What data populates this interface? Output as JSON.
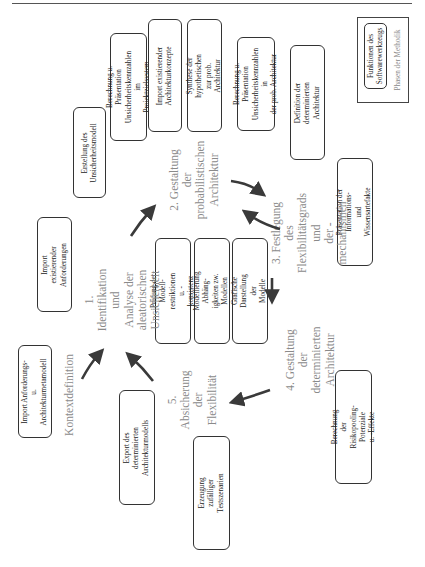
{
  "legend": {
    "tool_functions": "Funktionen des\nSoftwarewerkzeugs",
    "method_phases": "Phasen der Methodik"
  },
  "phases": {
    "context": "Kontextdefinition",
    "phase1": "1. Identifikation und\nAnalyse der aleatorischen\nUnsicherheit",
    "phase2": "2. Gestaltung der\nprobabilistischen\nArchitektur",
    "phase3": "3. Festlegung des\nFlexibilitätsgrads und\nder -mechanismen",
    "phase4": "4. Gestaltung der\ndeterminierten\nArchitektur",
    "phase5": "5. Absicherung der\nFlexibilität"
  },
  "functions": {
    "import_metamodel": "Import Anforderungs- u.\nArchitekturmetamodell",
    "import_requirements": "Import existierender\nAnforderungen",
    "create_uncertainty_model": "Erstellung des\nUnsicherheitsmodell",
    "calc_target_system": "Berechnung u. Präsentation\nUnsicherheitskennzahlen im\nProjektzielsystem",
    "import_arch_concepts": "Import existierender\nArchitekturkonzepte",
    "synthesis": "Synthese der hypothetischen\nzur prob. Architektur",
    "calc_prob_arch": "Berechnung u. Präsentation\nUnsicherheitskennzahlen in\nder prob. Architektur",
    "define_det_arch": "Definition der determinierten\nArchitektur",
    "present_artifacts": "Präsentation der Informations-\nund Wissensartefakte",
    "check_constraints": "Prüfung der Modell-\nrestriktionen u. -konsistenz",
    "model_dependencies": "Modellierung Abhäng-\nigkeiten zw. Modellen",
    "graphic_display": "Grafische Darstellung der\nModelle",
    "export_det_model": "Export des determinierten\nArchitekturmodells",
    "random_scenarios": "Erzeugung zufälliger\nTestszenarien",
    "risk_pooling": "Berechnung der\nRisikopooling-Potenziale\nu. -Effekte"
  },
  "colors": {
    "arrow": "#3a3a3a",
    "phase_text": "#8a8a8a",
    "box_border": "#333333"
  }
}
